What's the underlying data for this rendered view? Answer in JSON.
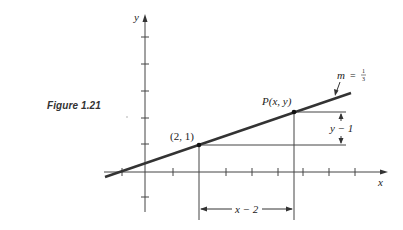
{
  "figure": {
    "caption": "Figure 1.21"
  },
  "axes": {
    "x_label": "x",
    "y_label": "y"
  },
  "labels": {
    "point_a": "(2, 1)",
    "point_p": "P(x, y)",
    "slope_m": "m",
    "slope_eq": "=",
    "slope_num": "1",
    "slope_den": "3",
    "dx_label": "x − 2",
    "dy_label": "y − 1"
  },
  "colors": {
    "ink": "#222222",
    "line": "#333333",
    "background": "#ffffff"
  },
  "geometry": {
    "point_a": [
      2,
      1
    ],
    "slope": "1/3",
    "x_ticks": [
      -1,
      1,
      2,
      3,
      4,
      5,
      6,
      7,
      8
    ],
    "y_ticks": [
      -1,
      1,
      2,
      3,
      4,
      5
    ]
  }
}
